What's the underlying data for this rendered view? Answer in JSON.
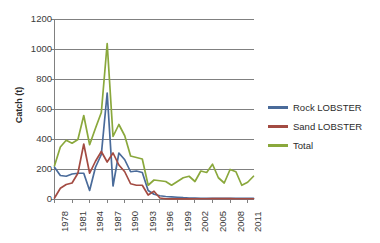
{
  "chart_data": {
    "type": "line",
    "title": "",
    "xlabel": "",
    "ylabel": "Catch (t)",
    "ylim": [
      0,
      1200
    ],
    "ytick_values": [
      0,
      200,
      400,
      600,
      800,
      1000,
      1200
    ],
    "ytick_labels": [
      "0",
      "200",
      "400",
      "600",
      "800",
      "1000",
      "1200"
    ],
    "grid": true,
    "legend_position": "right",
    "x": [
      1978,
      1979,
      1980,
      1981,
      1982,
      1983,
      1984,
      1985,
      1986,
      1987,
      1988,
      1989,
      1990,
      1991,
      1992,
      1993,
      1994,
      1995,
      1996,
      1997,
      1998,
      1999,
      2000,
      2001,
      2002,
      2003,
      2004,
      2005,
      2006,
      2007,
      2008,
      2009,
      2010,
      2011,
      2012
    ],
    "xtick_labels": [
      "1978",
      "1981",
      "1984",
      "1987",
      "1990",
      "1993",
      "1996",
      "1999",
      "2002",
      "2005",
      "2008",
      "2011"
    ],
    "xtick_values": [
      1978,
      1981,
      1984,
      1987,
      1990,
      1993,
      1996,
      1999,
      2002,
      2005,
      2008,
      2011
    ],
    "series": [
      {
        "name": "Rock LOBSTER",
        "color": "#4a6b9a",
        "values": [
          215,
          160,
          155,
          170,
          175,
          175,
          60,
          215,
          300,
          710,
          90,
          310,
          265,
          185,
          190,
          180,
          60,
          35,
          25,
          20,
          18,
          15,
          12,
          10,
          10,
          8,
          8,
          8,
          8,
          8,
          8,
          8,
          8,
          8,
          8
        ]
      },
      {
        "name": "Sand LOBSTER",
        "color": "#a34b42",
        "values": [
          10,
          75,
          100,
          110,
          175,
          370,
          175,
          255,
          320,
          250,
          310,
          230,
          185,
          105,
          95,
          95,
          30,
          55,
          10,
          5,
          4,
          4,
          4,
          4,
          5,
          5,
          5,
          6,
          6,
          6,
          6,
          5,
          5,
          5,
          5
        ]
      },
      {
        "name": "Total",
        "color": "#8aa83c",
        "values": [
          225,
          350,
          395,
          375,
          400,
          560,
          365,
          475,
          580,
          1040,
          420,
          500,
          425,
          290,
          280,
          270,
          95,
          130,
          125,
          120,
          95,
          120,
          145,
          155,
          120,
          190,
          180,
          235,
          145,
          110,
          200,
          185,
          95,
          115,
          155
        ]
      }
    ]
  },
  "legend": {
    "items": [
      {
        "label": "Rock LOBSTER",
        "color": "#4a6b9a"
      },
      {
        "label": "Sand LOBSTER",
        "color": "#a34b42"
      },
      {
        "label": "Total",
        "color": "#8aa83c"
      }
    ]
  },
  "axes": {
    "y_title": "Catch (t)"
  },
  "style": {
    "grid_color": "#808080",
    "axis_color": "#808080",
    "plot_bg": "#ffffff"
  }
}
